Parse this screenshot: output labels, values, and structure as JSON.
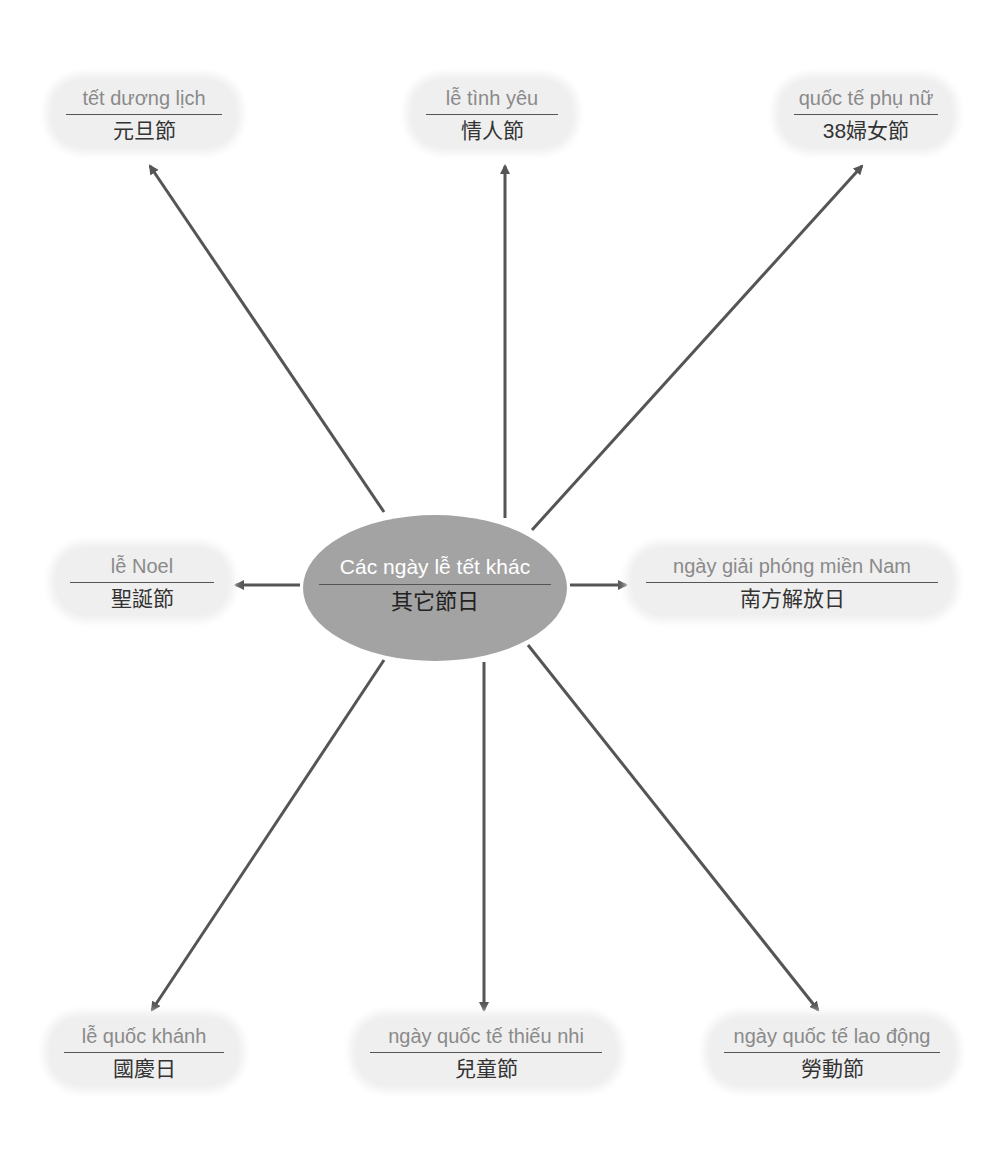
{
  "center": {
    "vn": "Các ngày lễ tết khác",
    "cn": "其它節日",
    "fill": "#a3a3a3"
  },
  "nodes": [
    {
      "id": "new-year",
      "vn": "tết dương lịch",
      "cn": "元旦節"
    },
    {
      "id": "valentine",
      "vn": "lễ tình yêu",
      "cn": "情人節"
    },
    {
      "id": "womens-day",
      "vn": "quốc tế phụ nữ",
      "cn": "38婦女節"
    },
    {
      "id": "christmas",
      "vn": "lễ Noel",
      "cn": "聖誕節"
    },
    {
      "id": "liberation-day",
      "vn": "ngày giải phóng miền Nam",
      "cn": "南方解放日"
    },
    {
      "id": "national-day",
      "vn": "lễ quốc khánh",
      "cn": "國慶日"
    },
    {
      "id": "childrens-day",
      "vn": "ngày quốc tế thiếu nhi",
      "cn": "兒童節"
    },
    {
      "id": "labor-day",
      "vn": "ngày quốc tế lao động",
      "cn": "勞動節"
    }
  ],
  "colors": {
    "arrow": "#555555",
    "node_bg": "#efefef",
    "vn_text": "#8a8a8a",
    "cn_text": "#333333"
  }
}
